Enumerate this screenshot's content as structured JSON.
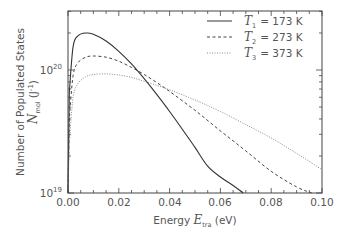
{
  "chart_data": {
    "type": "line",
    "title": "",
    "xlabel": "Energy E_tra (eV)",
    "xlabel_parts": {
      "prefix": "Energy ",
      "var": "E",
      "sub": "tra",
      "suffix": " (eV)"
    },
    "ylabel": "Number of Populated States N_mol (J^-1)",
    "ylabel_parts": {
      "line1": "Number of Populated States",
      "var": "N",
      "sub": "mol",
      "unit": "(J",
      "unit_sup": "-1",
      "unit_close": ")"
    },
    "xlim": [
      0.0,
      0.1
    ],
    "ylim": [
      1e+19,
      3e+20
    ],
    "yscale": "log",
    "x_ticks": [
      "0.00",
      "0.02",
      "0.04",
      "0.06",
      "0.08",
      "0.10"
    ],
    "y_ticks": [
      {
        "base": "10",
        "exp": "19"
      },
      {
        "base": "10",
        "exp": "20"
      }
    ],
    "grid": false,
    "legend_position": "upper right",
    "series": [
      {
        "name": "T1 = 173 K",
        "label_var": "T",
        "label_sub": "1",
        "label_val": "= 173 K",
        "style": "solid",
        "x": [
          0.0005,
          0.002,
          0.004,
          0.007,
          0.01,
          0.015,
          0.02,
          0.025,
          0.03,
          0.035,
          0.04,
          0.045,
          0.05,
          0.055,
          0.06,
          0.065,
          0.069
        ],
        "y": [
          6.5e+19,
          1.55e+20,
          1.9e+20,
          2e+20,
          1.95e+20,
          1.72e+20,
          1.42e+20,
          1.12e+20,
          8.5e+19,
          6.3e+19,
          4.6e+19,
          3.3e+19,
          2.35e+19,
          1.65e+19,
          1.35e+19,
          1.15e+19,
          1e+19
        ]
      },
      {
        "name": "T2 = 273 K",
        "label_var": "T",
        "label_sub": "2",
        "label_val": "= 273 K",
        "style": "dashed",
        "x": [
          0.0005,
          0.002,
          0.004,
          0.007,
          0.01,
          0.015,
          0.02,
          0.025,
          0.03,
          0.035,
          0.04,
          0.05,
          0.06,
          0.07,
          0.08,
          0.09,
          0.096
        ],
        "y": [
          4e+19,
          9e+19,
          1.15e+20,
          1.27e+20,
          1.3e+20,
          1.27e+20,
          1.18e+20,
          1.05e+20,
          9.2e+19,
          7.9e+19,
          6.7e+19,
          4.7e+19,
          3.2e+19,
          2.2e+19,
          1.5e+19,
          1.12e+19,
          1e+19
        ]
      },
      {
        "name": "T3 = 373 K",
        "label_var": "T",
        "label_sub": "3",
        "label_val": "= 373 K",
        "style": "dotted",
        "x": [
          0.0005,
          0.002,
          0.004,
          0.007,
          0.01,
          0.015,
          0.02,
          0.025,
          0.03,
          0.04,
          0.05,
          0.06,
          0.07,
          0.08,
          0.09,
          0.1
        ],
        "y": [
          2.5e+19,
          6e+19,
          7.8e+19,
          8.8e+19,
          9.2e+19,
          9.3e+19,
          9.1e+19,
          8.7e+19,
          8.1e+19,
          6.9e+19,
          5.7e+19,
          4.6e+19,
          3.6e+19,
          2.8e+19,
          2.1e+19,
          1.55e+19
        ]
      }
    ]
  },
  "panel_label": "",
  "colors": {
    "axis": "#444444",
    "text": "#555555",
    "solid": "#333333",
    "dashed": "#444444",
    "dotted": "#777777"
  }
}
